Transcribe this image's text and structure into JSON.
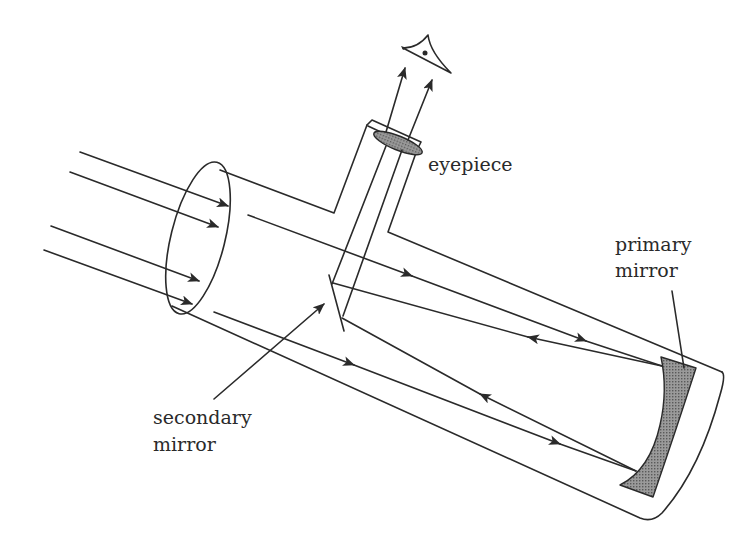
{
  "diagram": {
    "labels": {
      "eyepiece": "eyepiece",
      "primary_mirror_line1": "primary",
      "primary_mirror_line2": "mirror",
      "secondary_mirror_line1": "secondary",
      "secondary_mirror_line2": "mirror"
    },
    "colors": {
      "line": "#2a2a2a",
      "mirror_fill": "#8c8c8c",
      "lens_fill": "#7a7a7a",
      "background": "#ffffff"
    },
    "components": [
      "tube",
      "eyepiece",
      "lens",
      "secondary mirror",
      "primary mirror",
      "eye",
      "incoming light rays",
      "reflected rays"
    ]
  }
}
